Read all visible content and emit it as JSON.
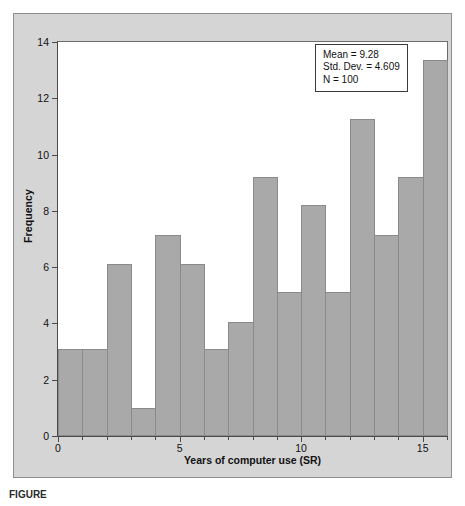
{
  "figure": {
    "background_color": "#d5d5d5",
    "plot_background_color": "#ffffff",
    "bar_color": "#a9a9a9",
    "bar_edge_color": "#8a8a8a",
    "axis_color": "#4a4a4a",
    "caption": "FIGURE"
  },
  "stats_box": {
    "mean_line": "Mean = 9.28",
    "std_dev_line": "Std. Dev. = 4.609",
    "n_line": "N = 100"
  },
  "chart_data": {
    "type": "bar",
    "title": "",
    "subtitle": "",
    "xlabel": "Years of computer use (SR)",
    "ylabel": "Frequency",
    "grid": false,
    "legend_position": "none",
    "xlim": [
      0,
      16
    ],
    "ylim": [
      0,
      14
    ],
    "xticks": [
      0,
      5,
      10,
      15
    ],
    "xtick_labels": [
      "0",
      "5",
      "10",
      "15"
    ],
    "yticks": [
      0,
      2,
      4,
      6,
      8,
      10,
      12,
      14
    ],
    "ytick_labels": [
      "0",
      "2",
      "4",
      "6",
      "8",
      "10",
      "12",
      "14"
    ],
    "bin_width": 1,
    "bin_edges": [
      0,
      1,
      2,
      3,
      4,
      5,
      6,
      7,
      8,
      9,
      10,
      11,
      12,
      13,
      14,
      15,
      16
    ],
    "categories": [
      "0-1",
      "1-2",
      "2-3",
      "3-4",
      "4-5",
      "5-6",
      "6-7",
      "7-8",
      "8-9",
      "9-10",
      "10-11",
      "11-12",
      "12-13",
      "13-14",
      "14-15",
      "15-16"
    ],
    "values": [
      3.1,
      3.1,
      6.1,
      1.0,
      7.15,
      6.1,
      3.1,
      4.05,
      9.2,
      5.1,
      8.2,
      5.1,
      11.25,
      7.15,
      9.2,
      13.35
    ],
    "annotations": [
      "Mean = 9.28",
      "Std. Dev. = 4.609",
      "N = 100"
    ]
  }
}
